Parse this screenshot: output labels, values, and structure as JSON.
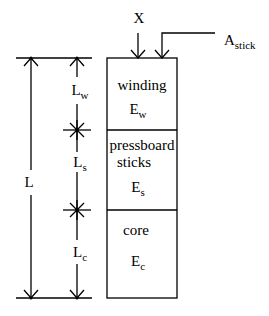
{
  "diagram": {
    "title": "",
    "top_labels": {
      "x": "X",
      "a_stick": {
        "base": "A",
        "sub": "stick"
      }
    },
    "dimensions": {
      "total": {
        "base": "L",
        "sub": ""
      },
      "winding": {
        "base": "L",
        "sub": "w"
      },
      "sticks": {
        "base": "L",
        "sub": "s"
      },
      "core": {
        "base": "L",
        "sub": "c"
      }
    },
    "sections": [
      {
        "name": "winding",
        "label": "winding",
        "modulus": {
          "base": "E",
          "sub": "w"
        }
      },
      {
        "name": "pressboard-sticks",
        "label_line1": "pressboard",
        "label_line2": "sticks",
        "modulus": {
          "base": "E",
          "sub": "s"
        }
      },
      {
        "name": "core",
        "label": "core",
        "modulus": {
          "base": "E",
          "sub": "c"
        }
      }
    ],
    "colors": {
      "stroke": "#000000",
      "background": "#ffffff"
    }
  }
}
